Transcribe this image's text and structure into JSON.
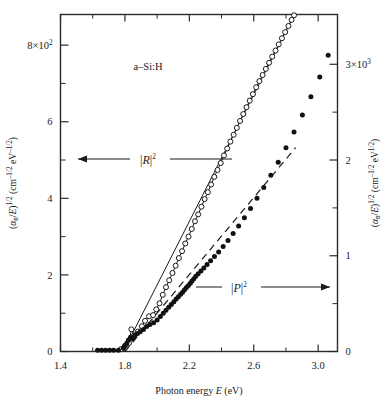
{
  "chart_data": {
    "type": "scatter",
    "title": "",
    "sample_label": "a–Si:H",
    "xlabel": "Photon energy E (eV)",
    "xlabel_parts": {
      "pre": "Photon energy ",
      "italic": "E",
      "post": " (eV)"
    },
    "ylabel_left": "(αn/E)1/2 (cm–1/2 eV–1/2)",
    "ylabel_right": "(αn/E)1/2 (cm–1/2 eV1/2)",
    "xlim": [
      1.4,
      3.12
    ],
    "xticks": [
      1.4,
      1.8,
      2.2,
      2.6,
      3.0
    ],
    "xticklabels": [
      "1.4",
      "1.8",
      "2.2",
      "2.6",
      "3.0"
    ],
    "xminorticks": [
      1.6,
      2.0,
      2.4,
      2.8
    ],
    "ylim_left": [
      0,
      880
    ],
    "yticks_left": [
      0,
      200,
      400,
      600,
      800
    ],
    "yticklabels_left": [
      "0",
      "2",
      "4",
      "6",
      "8×10²"
    ],
    "yminorticks_left": [
      100,
      300,
      500,
      700
    ],
    "ylim_right": [
      0,
      3520
    ],
    "yticks_right": [
      0,
      1000,
      2000,
      3000
    ],
    "yticklabels_right": [
      "0",
      "1",
      "2",
      "3×10³"
    ],
    "yminorticks_right": [
      500,
      1500,
      2500
    ],
    "grid": false,
    "legend_position": "inline-annotations",
    "annotations": [
      {
        "name": "R-squared",
        "text": "|R|2",
        "symbol": "R",
        "exponent": "2",
        "arrow": "left",
        "axis": "left"
      },
      {
        "name": "P-squared",
        "text": "|P|2",
        "symbol": "P",
        "exponent": "2",
        "arrow": "right",
        "axis": "right"
      }
    ],
    "series": [
      {
        "name": "|R|2",
        "marker": "open-circle",
        "axis": "left",
        "line": "solid",
        "points": [
          [
            1.775,
            6
          ],
          [
            1.8,
            14
          ],
          [
            1.825,
            22
          ],
          [
            1.84,
            58
          ],
          [
            1.858,
            42
          ],
          [
            1.88,
            52
          ],
          [
            1.905,
            66
          ],
          [
            1.925,
            80
          ],
          [
            1.95,
            92
          ],
          [
            1.975,
            95
          ],
          [
            1.995,
            110
          ],
          [
            2.015,
            126
          ],
          [
            2.035,
            148
          ],
          [
            2.055,
            168
          ],
          [
            2.075,
            186
          ],
          [
            2.095,
            205
          ],
          [
            2.115,
            224
          ],
          [
            2.135,
            244
          ],
          [
            2.155,
            262
          ],
          [
            2.175,
            282
          ],
          [
            2.195,
            300
          ],
          [
            2.215,
            320
          ],
          [
            2.235,
            340
          ],
          [
            2.255,
            358
          ],
          [
            2.275,
            378
          ],
          [
            2.295,
            398
          ],
          [
            2.315,
            416
          ],
          [
            2.335,
            436
          ],
          [
            2.355,
            456
          ],
          [
            2.375,
            474
          ],
          [
            2.395,
            492
          ],
          [
            2.415,
            512
          ],
          [
            2.435,
            530
          ],
          [
            2.455,
            548
          ],
          [
            2.475,
            566
          ],
          [
            2.495,
            584
          ],
          [
            2.515,
            602
          ],
          [
            2.535,
            620
          ],
          [
            2.555,
            638
          ],
          [
            2.575,
            655
          ],
          [
            2.595,
            672
          ],
          [
            2.615,
            690
          ],
          [
            2.635,
            706
          ],
          [
            2.655,
            722
          ],
          [
            2.675,
            738
          ],
          [
            2.695,
            754
          ],
          [
            2.715,
            770
          ],
          [
            2.735,
            786
          ],
          [
            2.755,
            802
          ],
          [
            2.775,
            818
          ],
          [
            2.795,
            834
          ],
          [
            2.815,
            850
          ],
          [
            2.835,
            866
          ],
          [
            2.85,
            878
          ]
        ]
      },
      {
        "name": "|P|2",
        "marker": "filled-circle",
        "axis": "right",
        "line": "none",
        "points": [
          [
            1.63,
            12
          ],
          [
            1.655,
            12
          ],
          [
            1.68,
            12
          ],
          [
            1.705,
            12
          ],
          [
            1.73,
            12
          ],
          [
            1.76,
            14
          ],
          [
            1.79,
            36
          ],
          [
            1.8,
            62
          ],
          [
            1.812,
            88
          ],
          [
            1.822,
            120
          ],
          [
            1.835,
            150
          ],
          [
            1.848,
            132
          ],
          [
            1.862,
            168
          ],
          [
            1.878,
            188
          ],
          [
            1.895,
            205
          ],
          [
            1.915,
            230
          ],
          [
            1.935,
            262
          ],
          [
            1.955,
            282
          ],
          [
            1.978,
            300
          ],
          [
            2.0,
            330
          ],
          [
            2.02,
            366
          ],
          [
            2.038,
            400
          ],
          [
            2.055,
            430
          ],
          [
            2.072,
            462
          ],
          [
            2.088,
            492
          ],
          [
            2.104,
            520
          ],
          [
            2.118,
            548
          ],
          [
            2.132,
            572
          ],
          [
            2.146,
            598
          ],
          [
            2.158,
            620
          ],
          [
            2.17,
            644
          ],
          [
            2.182,
            668
          ],
          [
            2.194,
            690
          ],
          [
            2.206,
            712
          ],
          [
            2.216,
            736
          ],
          [
            2.228,
            760
          ],
          [
            2.24,
            786
          ],
          [
            2.255,
            812
          ],
          [
            2.272,
            840
          ],
          [
            2.29,
            872
          ],
          [
            2.31,
            908
          ],
          [
            2.332,
            948
          ],
          [
            2.356,
            992
          ],
          [
            2.382,
            1040
          ],
          [
            2.41,
            1096
          ],
          [
            2.44,
            1160
          ],
          [
            2.472,
            1232
          ],
          [
            2.506,
            1310
          ],
          [
            2.542,
            1398
          ],
          [
            2.58,
            1494
          ],
          [
            2.62,
            1600
          ],
          [
            2.662,
            1714
          ],
          [
            2.706,
            1840
          ],
          [
            2.752,
            1978
          ],
          [
            2.8,
            2128
          ],
          [
            2.85,
            2292
          ],
          [
            2.902,
            2470
          ],
          [
            2.955,
            2660
          ],
          [
            3.01,
            2868
          ],
          [
            3.062,
            3094
          ]
        ]
      }
    ],
    "fit_lines": [
      {
        "name": "R-fit-solid",
        "style": "solid",
        "axis": "left",
        "from": [
          1.79,
          0
        ],
        "to": [
          2.85,
          878
        ]
      },
      {
        "name": "P-fit-dashed",
        "style": "dashed",
        "axis": "right",
        "from": [
          1.8,
          0
        ],
        "to": [
          2.86,
          2130
        ]
      }
    ]
  },
  "axis_labels": {
    "left_axis_prefix": "(",
    "left_axis_alpha": "α",
    "left_axis_sub_n": "n",
    "left_axis_slash_E": "/E",
    "left_axis_exp": "1/2",
    "left_axis_units": "(cm",
    "left_axis_units_exp1": "–1/2",
    "left_axis_units_ev": "eV",
    "left_axis_units_exp2": "–1/2",
    "left_axis_close": ")",
    "right_axis_units_exp2": "1/2"
  }
}
